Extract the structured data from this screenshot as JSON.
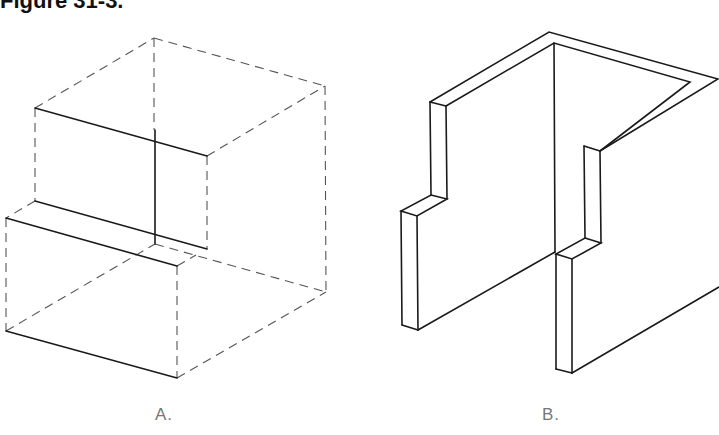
{
  "figure": {
    "title": "Figure 31-3."
  },
  "drawings": [
    {
      "label": "A.",
      "description": "Isometric view with hidden (dashed) bounding box and visible solid step edges"
    },
    {
      "label": "B.",
      "description": "Isometric view of a stepped U-shaped wall structure"
    }
  ],
  "colors": {
    "line": "#1a1a1a",
    "hidden_line": "#555555",
    "label": "#777777",
    "background": "#ffffff"
  }
}
